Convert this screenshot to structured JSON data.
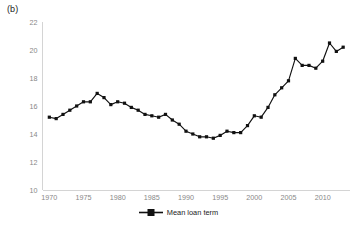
{
  "panel": {
    "label": "(b)"
  },
  "legend": {
    "position": "bottom-center",
    "marker_icon": "line-square-marker-icon",
    "entries": [
      {
        "label": "Mean loan term",
        "color": "#111111"
      }
    ],
    "label": "Mean loan term"
  },
  "colors": {
    "series": "#111111",
    "axis": "#d4d4d4",
    "tick_text": "#888888",
    "background": "#ffffff"
  },
  "chart_data": {
    "type": "line",
    "title": "(b)",
    "subtitle": "",
    "xlabel": "",
    "ylabel": "",
    "xlim": [
      1969,
      2014
    ],
    "ylim": [
      10,
      22
    ],
    "yticks": [
      10,
      12,
      14,
      16,
      18,
      20,
      22
    ],
    "xticks": [
      1970,
      1975,
      1980,
      1985,
      1990,
      1995,
      2000,
      2005,
      2010
    ],
    "ytick_labels": [
      "10",
      "12",
      "14",
      "16",
      "18",
      "20",
      "22"
    ],
    "xtick_labels": [
      "1970",
      "1975",
      "1980",
      "1985",
      "1990",
      "1995",
      "2000",
      "2005",
      "2010"
    ],
    "grid": false,
    "legend_position": "bottom",
    "marker": "square",
    "x": [
      1970,
      1971,
      1972,
      1973,
      1974,
      1975,
      1976,
      1977,
      1978,
      1979,
      1980,
      1981,
      1982,
      1983,
      1984,
      1985,
      1986,
      1987,
      1988,
      1989,
      1990,
      1991,
      1992,
      1993,
      1994,
      1995,
      1996,
      1997,
      1998,
      1999,
      2000,
      2001,
      2002,
      2003,
      2004,
      2005,
      2006,
      2007,
      2008,
      2009,
      2010,
      2011,
      2012,
      2013
    ],
    "series": [
      {
        "name": "Mean loan term",
        "color": "#111111",
        "values": [
          15.2,
          15.1,
          15.4,
          15.7,
          16.0,
          16.3,
          16.3,
          16.9,
          16.6,
          16.1,
          16.3,
          16.2,
          15.9,
          15.7,
          15.4,
          15.3,
          15.2,
          15.4,
          15.0,
          14.7,
          14.2,
          14.0,
          13.8,
          13.8,
          13.7,
          13.9,
          14.2,
          14.1,
          14.1,
          14.6,
          15.3,
          15.2,
          15.9,
          16.8,
          17.3,
          17.8,
          19.4,
          18.9,
          18.9,
          18.7,
          19.2,
          20.5,
          19.9,
          20.2
        ]
      }
    ]
  }
}
